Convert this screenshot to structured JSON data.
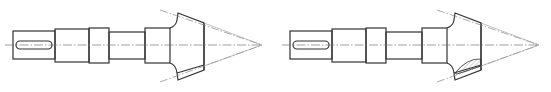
{
  "figure": {
    "type": "engineering-drawing",
    "views": [
      {
        "id": "left",
        "label": "",
        "offset_x": 0,
        "section_hatched": false
      },
      {
        "id": "right",
        "label": "",
        "offset_x": 277,
        "section_hatched": true
      }
    ],
    "colors": {
      "outline": "#333333",
      "centerline": "#777777",
      "pitch_cone": "#888888",
      "hatch": "#555555",
      "background": "#ffffff"
    }
  }
}
